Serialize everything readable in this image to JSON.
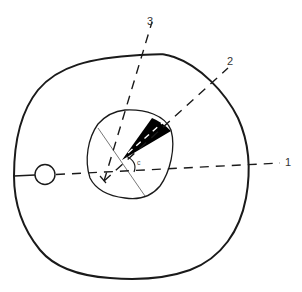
{
  "diagram": {
    "type": "cross-section schematic",
    "labels": {
      "line_1": "1",
      "line_2": "2",
      "line_3": "3",
      "angle": "c"
    },
    "elements": [
      {
        "id": "outer-outline",
        "kind": "closed curve"
      },
      {
        "id": "inner-outline",
        "kind": "closed curve"
      },
      {
        "id": "small-circle",
        "kind": "circle"
      },
      {
        "id": "dashed-line-1",
        "kind": "dashed line",
        "label": "1"
      },
      {
        "id": "dashed-line-2",
        "kind": "dashed line",
        "label": "2"
      },
      {
        "id": "dashed-line-3",
        "kind": "dashed line",
        "label": "3"
      },
      {
        "id": "black-wedge",
        "kind": "filled sector"
      },
      {
        "id": "thin-diagonal-line",
        "kind": "solid line"
      },
      {
        "id": "angle-arc",
        "kind": "arc",
        "label": "c"
      }
    ],
    "colors": {
      "stroke": "#1a1a1a",
      "thin_stroke": "#555555",
      "fill_wedge": "#000000",
      "background": "#ffffff"
    }
  }
}
